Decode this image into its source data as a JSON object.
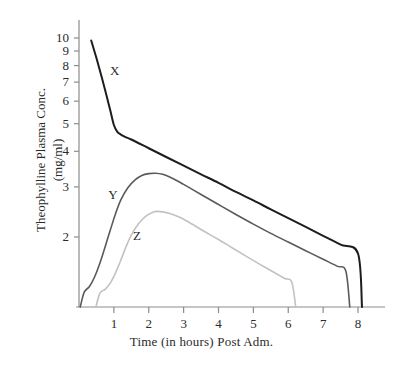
{
  "chart_data": {
    "type": "line",
    "title": "",
    "xlabel": "Time (in hours) Post Adm.",
    "ylabel_line1": "Theophylline Plasma Conc.",
    "ylabel_line2": "(mg/ml)",
    "yscale": "log",
    "xscale": "linear",
    "xlim": [
      0,
      8.6
    ],
    "ylim": [
      1.25,
      11.0
    ],
    "grid": false,
    "legend": "inline-curve-labels",
    "xticks": [
      1,
      2,
      3,
      4,
      5,
      6,
      7,
      8
    ],
    "xtick_labels": [
      "1",
      "2",
      "3",
      "4",
      "5",
      "6",
      "7",
      "8"
    ],
    "yticks": [
      2,
      3,
      4,
      5,
      6,
      7,
      8,
      9,
      10
    ],
    "ytick_labels": [
      "2",
      "3",
      "4",
      "5",
      "6",
      "7",
      "8",
      "9",
      "10"
    ],
    "series": [
      {
        "name": "X",
        "label": "X",
        "color": "#1d1d1d",
        "width": 2.0,
        "label_x": 1.0,
        "label_y": 7.6,
        "x": [
          0.35,
          0.5,
          0.65,
          0.8,
          0.9,
          1.0,
          1.1,
          1.2,
          1.35,
          1.5,
          2.0,
          2.5,
          3.0,
          3.5,
          4.0,
          4.5,
          5.0,
          5.5,
          6.0,
          6.5,
          7.0,
          7.5,
          8.0
        ],
        "y": [
          9.8,
          8.5,
          7.3,
          6.2,
          5.55,
          4.95,
          4.68,
          4.58,
          4.48,
          4.4,
          4.1,
          3.82,
          3.56,
          3.32,
          3.1,
          2.88,
          2.69,
          2.5,
          2.33,
          2.17,
          2.02,
          1.88,
          1.75
        ]
      },
      {
        "name": "Y",
        "label": "Y",
        "color": "#5a5a5a",
        "width": 1.6,
        "label_x": 0.95,
        "label_y": 2.78,
        "x": [
          0.15,
          0.3,
          0.45,
          0.6,
          0.75,
          0.9,
          1.05,
          1.2,
          1.4,
          1.6,
          1.8,
          2.0,
          2.2,
          2.4,
          2.6,
          2.8,
          3.0,
          3.5,
          4.0,
          4.5,
          5.0,
          5.5,
          6.0,
          6.5,
          7.0,
          7.4,
          7.65
        ],
        "y": [
          1.28,
          1.34,
          1.45,
          1.62,
          1.85,
          2.12,
          2.42,
          2.7,
          2.98,
          3.17,
          3.29,
          3.34,
          3.35,
          3.32,
          3.25,
          3.16,
          3.06,
          2.82,
          2.6,
          2.4,
          2.22,
          2.06,
          1.92,
          1.79,
          1.67,
          1.58,
          1.52
        ]
      },
      {
        "name": "Z",
        "label": "Z",
        "color": "#c2c2c2",
        "width": 1.6,
        "label_x": 1.66,
        "label_y": 2.0,
        "x": [
          0.6,
          0.75,
          0.9,
          1.05,
          1.2,
          1.35,
          1.5,
          1.7,
          1.9,
          2.1,
          2.25,
          2.4,
          2.6,
          2.8,
          3.0,
          3.3,
          3.6,
          4.0,
          4.4,
          4.8,
          5.2,
          5.6,
          5.9,
          6.1
        ],
        "y": [
          1.27,
          1.31,
          1.38,
          1.5,
          1.66,
          1.85,
          2.03,
          2.22,
          2.36,
          2.44,
          2.46,
          2.45,
          2.42,
          2.37,
          2.31,
          2.2,
          2.09,
          1.96,
          1.83,
          1.71,
          1.6,
          1.5,
          1.43,
          1.39
        ]
      }
    ]
  },
  "axes": {
    "x_axis_color": "#8c8c8c",
    "y_axis_color": "#8c8c8c",
    "tick_color": "#8c8c8c"
  }
}
